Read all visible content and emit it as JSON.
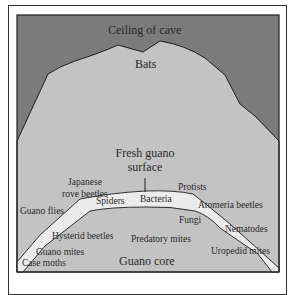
{
  "diagram": {
    "colors": {
      "ceiling": "#7b7b7b",
      "bats_zone": "#c3c3c3",
      "fresh_guano_band": "#ececec",
      "guano_core": "#c3c3c3",
      "outline": "#1e1e1e"
    },
    "regions": {
      "ceiling": "Ceiling of cave",
      "bats": "Bats",
      "surface_line1": "Fresh guano",
      "surface_line2": "surface",
      "core": "Guano core"
    },
    "organisms": {
      "japanese_line1": "Japanese",
      "japanese_line2": "rove beetles",
      "guano_flies": "Guano flies",
      "spiders": "Spiders",
      "bacteria": "Bacteria",
      "protists": "Protists",
      "atomeria": "Atomeria beetles",
      "fungi": "Fungi",
      "nematodes": "Nematodes",
      "hysterid": "Hysterid beetles",
      "predatory_mites": "Predatory mites",
      "guano_mites": "Guano mites",
      "uropedid": "Uropedid mites",
      "case_moths": "Case moths"
    }
  }
}
